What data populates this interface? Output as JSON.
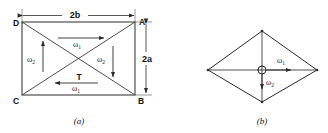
{
  "figure": {
    "background_color": "#ffffff",
    "line_color": "#2b2b2b",
    "text_color": "#111111",
    "panels": [
      {
        "id": "panel-a",
        "caption": "(a)",
        "shape": "rectangle",
        "description": "Rectangle with both diagonals drawn, labelled corners and dimension arrows",
        "corners": [
          {
            "id": "corner-d",
            "label": "D",
            "position": "top-left"
          },
          {
            "id": "corner-a",
            "label": "A",
            "position": "top-right"
          },
          {
            "id": "corner-b",
            "label": "B",
            "position": "bottom-right"
          },
          {
            "id": "corner-c",
            "label": "C",
            "position": "bottom-left"
          }
        ],
        "dimensions": [
          {
            "id": "dim-width",
            "label": "2b",
            "orientation": "horizontal",
            "placement": "above"
          },
          {
            "id": "dim-height",
            "label": "2a",
            "orientation": "vertical",
            "placement": "right"
          }
        ],
        "vectors": [
          {
            "id": "omega1-top",
            "symbol": "ω",
            "subscript": "1",
            "direction": "right",
            "placement": "upper-interior"
          },
          {
            "id": "omega2-left",
            "symbol": "ω",
            "subscript": "2",
            "direction": "up",
            "placement": "left-interior"
          },
          {
            "id": "omega2-right",
            "symbol": "ω",
            "subscript": "2",
            "direction": "down",
            "placement": "right-interior"
          },
          {
            "id": "omega1-bottom",
            "symbol": "ω",
            "subscript": "1",
            "direction": "left",
            "placement": "lower-interior"
          }
        ],
        "torque": {
          "id": "torque-t",
          "label": "T"
        }
      },
      {
        "id": "panel-b",
        "caption": "(b)",
        "shape": "rhombus",
        "description": "Rhombus with both diagonals drawn and a circular pivot at the centre",
        "pivot": {
          "id": "center-pivot",
          "symbol": "crossed-circle"
        },
        "vectors": [
          {
            "id": "omega1-right",
            "symbol": "ω",
            "subscript": "1",
            "direction": "right",
            "placement": "center-right"
          },
          {
            "id": "omega2-down",
            "symbol": "ω",
            "subscript": "2",
            "direction": "down",
            "placement": "center-below"
          }
        ]
      }
    ]
  }
}
